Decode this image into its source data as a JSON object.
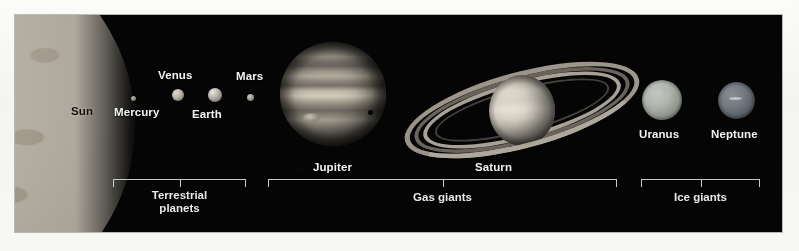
{
  "figure": {
    "kind": "astronomical-scale-comparison",
    "background_color": "#f6f6f4",
    "plate_color": "#050505",
    "label_color": "#f2f2f2",
    "bracket_color": "#c9c9c9"
  },
  "bodies": [
    {
      "key": "sun",
      "label": "Sun",
      "label_color": "#12100e"
    },
    {
      "key": "mercury",
      "label": "Mercury",
      "label_color": "#f2f2f2"
    },
    {
      "key": "venus",
      "label": "Venus",
      "label_color": "#f2f2f2"
    },
    {
      "key": "earth",
      "label": "Earth",
      "label_color": "#f2f2f2"
    },
    {
      "key": "mars",
      "label": "Mars",
      "label_color": "#f2f2f2"
    },
    {
      "key": "jupiter",
      "label": "Jupiter",
      "label_color": "#f2f2f2"
    },
    {
      "key": "saturn",
      "label": "Saturn",
      "label_color": "#f2f2f2"
    },
    {
      "key": "uranus",
      "label": "Uranus",
      "label_color": "#f2f2f2"
    },
    {
      "key": "neptune",
      "label": "Neptune",
      "label_color": "#f2f2f2"
    }
  ],
  "labels": {
    "sun": "Sun",
    "mercury": "Mercury",
    "venus": "Venus",
    "earth": "Earth",
    "mars": "Mars",
    "jupiter": "Jupiter",
    "saturn": "Saturn",
    "uranus": "Uranus",
    "neptune": "Neptune"
  },
  "groups": [
    {
      "key": "terrestrial",
      "caption_line1": "Terrestrial",
      "caption_line2": "planets",
      "members": [
        "Mercury",
        "Venus",
        "Earth",
        "Mars"
      ]
    },
    {
      "key": "gas_giants",
      "caption_line1": "Gas giants",
      "caption_line2": "",
      "members": [
        "Jupiter",
        "Saturn"
      ]
    },
    {
      "key": "ice_giants",
      "caption_line1": "Ice giants",
      "caption_line2": "",
      "members": [
        "Uranus",
        "Neptune"
      ]
    }
  ],
  "group_captions": {
    "terrestrial_line1": "Terrestrial",
    "terrestrial_line2": "planets",
    "gas_giants": "Gas giants",
    "ice_giants": "Ice giants"
  }
}
